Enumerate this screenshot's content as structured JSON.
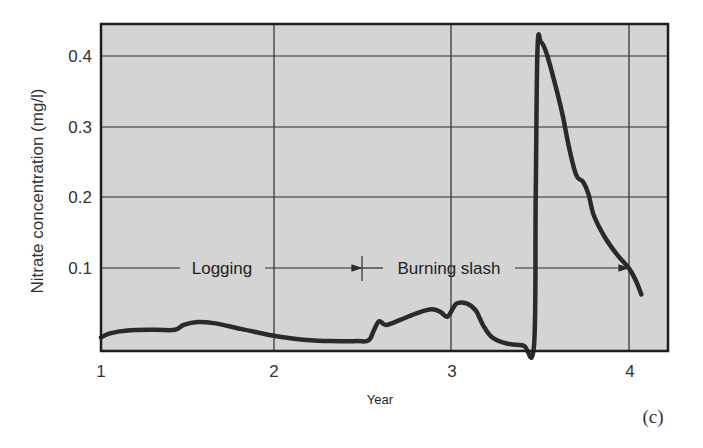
{
  "chart_data": {
    "type": "line",
    "title": "",
    "xlabel": "Year",
    "ylabel": "Nitrate concentration (mg/l)",
    "panel_label": "(c)",
    "xlim": [
      1,
      4.22
    ],
    "ylim": [
      -0.017,
      0.446
    ],
    "grid": true,
    "background": "#d4d4d4",
    "line_color": "#2a2a2a",
    "x_ticks": [
      {
        "value": 1,
        "label": "1"
      },
      {
        "value": 2,
        "label": "2"
      },
      {
        "value": 3,
        "label": "3"
      },
      {
        "value": 4,
        "label": "4"
      }
    ],
    "y_ticks": [
      {
        "value": 0.1,
        "label": "0.1"
      },
      {
        "value": 0.2,
        "label": "0.2"
      },
      {
        "value": 0.3,
        "label": "0.3"
      },
      {
        "value": 0.4,
        "label": "0.4"
      }
    ],
    "series": [
      {
        "name": "Nitrate concentration",
        "x": [
          1.0,
          1.05,
          1.15,
          1.3,
          1.42,
          1.47,
          1.55,
          1.65,
          1.8,
          1.95,
          2.05,
          2.15,
          2.3,
          2.45,
          2.52,
          2.55,
          2.58,
          2.62,
          2.7,
          2.8,
          2.88,
          2.93,
          2.97,
          3.02,
          3.08,
          3.13,
          3.17,
          3.22,
          3.3,
          3.4,
          3.46,
          3.47,
          3.48,
          3.5,
          3.53,
          3.57,
          3.62,
          3.66,
          3.7,
          3.74,
          3.77,
          3.8,
          3.86,
          3.93,
          4.0,
          4.04,
          4.07
        ],
        "y": [
          0.002,
          0.008,
          0.012,
          0.013,
          0.013,
          0.02,
          0.024,
          0.022,
          0.014,
          0.006,
          0.002,
          -0.001,
          -0.003,
          -0.003,
          -0.002,
          0.012,
          0.025,
          0.02,
          0.027,
          0.037,
          0.042,
          0.038,
          0.032,
          0.05,
          0.05,
          0.04,
          0.02,
          0.003,
          -0.006,
          -0.009,
          -0.01,
          0.2,
          0.41,
          0.42,
          0.405,
          0.37,
          0.32,
          0.27,
          0.232,
          0.222,
          0.205,
          0.175,
          0.145,
          0.12,
          0.1,
          0.082,
          0.063
        ]
      }
    ],
    "annotations": [
      {
        "text": "Logging",
        "x_start": 1.0,
        "x_end": 2.5,
        "y": 0.1,
        "arrow": "both-end-right"
      },
      {
        "text": "Burning slash",
        "x_start": 2.5,
        "x_end": 4.0,
        "y": 0.1,
        "arrow": "right"
      }
    ]
  },
  "labels": {
    "ylabel": "Nitrate concentration (mg/l)",
    "xlabel": "Year",
    "panel": "(c)",
    "logging": "Logging",
    "burning": "Burning slash",
    "x1": "1",
    "x2": "2",
    "x3": "3",
    "x4": "4",
    "y1": "0.1",
    "y2": "0.2",
    "y3": "0.3",
    "y4": "0.4"
  }
}
